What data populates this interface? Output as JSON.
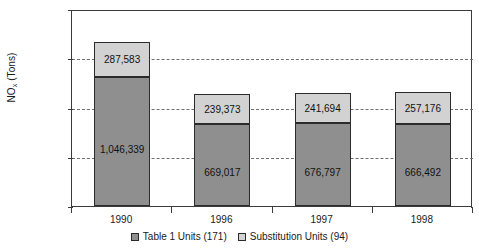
{
  "chart_data": {
    "type": "bar",
    "subtype": "stacked-vertical",
    "title": "",
    "xlabel": "",
    "ylabel": "NOx (Tons)",
    "ylabel_parts": {
      "prefix": "NO",
      "subscript": "x",
      "suffix": " (Tons)"
    },
    "categories": [
      "1990",
      "1996",
      "1997",
      "1998"
    ],
    "ylim": [
      0,
      1600000
    ],
    "ytick_labels": [
      "0",
      "400,000",
      "800,000",
      "1,200,000",
      "1,600,000"
    ],
    "ytick_values": [
      0,
      400000,
      800000,
      1200000,
      1600000
    ],
    "grid": true,
    "grid_style": "dashed-horizontal",
    "legend_position": "bottom-center",
    "series": [
      {
        "name": "Table 1 Units (171)",
        "color": "#8f8f8f",
        "values": [
          1046339,
          669017,
          676797,
          666492
        ],
        "labels": [
          "1,046,339",
          "669,017",
          "676,797",
          "666,492"
        ]
      },
      {
        "name": "Substitution Units (94)",
        "color": "#d2d2d2",
        "values": [
          287583,
          239373,
          241694,
          257176
        ],
        "labels": [
          "287,583",
          "239,373",
          "241,694",
          "257,176"
        ]
      }
    ],
    "totals": [
      1333922,
      908390,
      918491,
      923668
    ]
  }
}
